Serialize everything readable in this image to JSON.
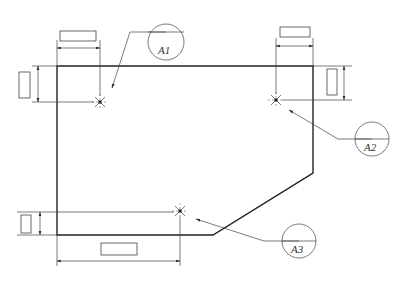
{
  "diagram": {
    "type": "technical-drawing",
    "title": "",
    "points": [
      {
        "id": "A1",
        "label": "A1",
        "x": 100,
        "y": 102,
        "balloon": {
          "cx": 166,
          "cy": 42,
          "r": 18
        },
        "leader_from": [
          148,
          32
        ],
        "leader_to": [
          112,
          88
        ]
      },
      {
        "id": "A2",
        "label": "A2",
        "x": 276,
        "y": 100,
        "balloon": {
          "cx": 372,
          "cy": 139,
          "r": 17
        },
        "leader_from": [
          355,
          139
        ],
        "leader_to": [
          289,
          110
        ]
      },
      {
        "id": "A3",
        "label": "A3",
        "x": 180,
        "y": 211,
        "balloon": {
          "cx": 299,
          "cy": 241,
          "r": 17
        },
        "leader_from": [
          282,
          241
        ],
        "leader_to": [
          196,
          219
        ]
      }
    ],
    "dimension_boxes": [
      {
        "id": "dim-top-left",
        "value": ""
      },
      {
        "id": "dim-top-right",
        "value": ""
      },
      {
        "id": "dim-left-upper",
        "value": ""
      },
      {
        "id": "dim-right-upper",
        "value": ""
      },
      {
        "id": "dim-left-lower",
        "value": ""
      },
      {
        "id": "dim-bottom",
        "value": ""
      }
    ],
    "colors": {
      "line": "#222222",
      "background": "#ffffff"
    }
  }
}
